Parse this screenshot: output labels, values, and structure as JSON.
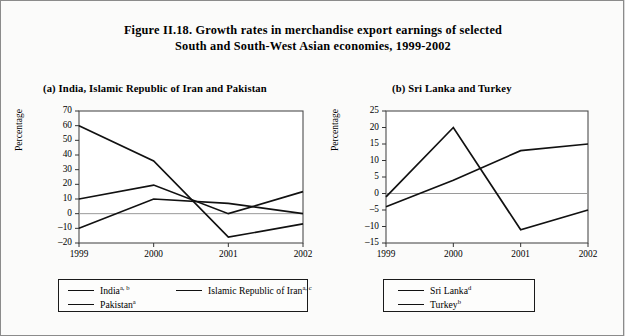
{
  "figure": {
    "title_line1": "Figure II.18.  Growth rates in merchandise export earnings of selected",
    "title_line2": "South and South-West Asian economies, 1999-2002"
  },
  "panel_a": {
    "title": "(a)  India, Islamic Republic of Iran and Pakistan",
    "ylabel": "Percentage"
  },
  "panel_b": {
    "title": "(b)  Sri Lanka and Turkey",
    "ylabel": "Percentage"
  },
  "legend_a": {
    "items": [
      {
        "label": "India",
        "sup": "a, b"
      },
      {
        "label": "Islamic Republic of Iran",
        "sup": "a, c"
      },
      {
        "label": "Pakistan",
        "sup": "a"
      }
    ]
  },
  "legend_b": {
    "items": [
      {
        "label": "Sri Lanka",
        "sup": "d"
      },
      {
        "label": "Turkey",
        "sup": "b"
      }
    ]
  },
  "chart_data": [
    {
      "type": "line",
      "panel": "(a)",
      "title": "(a)  India, Islamic Republic of Iran and Pakistan",
      "xlabel": "",
      "ylabel": "Percentage",
      "x": [
        "1999",
        "2000",
        "2001",
        "2002"
      ],
      "ylim": [
        -20,
        70
      ],
      "yticks": [
        70,
        60,
        50,
        40,
        30,
        20,
        10,
        0,
        -10,
        -20
      ],
      "grid": false,
      "zero_line": true,
      "legend_position": "below",
      "series": [
        {
          "name": "India",
          "sup": "a, b",
          "values": [
            10,
            19.5,
            0,
            15
          ]
        },
        {
          "name": "Islamic Republic of Iran",
          "sup": "a, c",
          "values": [
            60,
            36,
            -16,
            -7
          ]
        },
        {
          "name": "Pakistan",
          "sup": "a",
          "values": [
            -10,
            10,
            7,
            0
          ]
        }
      ]
    },
    {
      "type": "line",
      "panel": "(b)",
      "title": "(b)  Sri Lanka and Turkey",
      "xlabel": "",
      "ylabel": "Percentage",
      "x": [
        "1999",
        "2000",
        "2001",
        "2002"
      ],
      "ylim": [
        -15,
        25
      ],
      "yticks": [
        25,
        20,
        15,
        10,
        5,
        0,
        -5,
        -10,
        -15
      ],
      "grid": false,
      "zero_line": true,
      "legend_position": "below",
      "series": [
        {
          "name": "Sri Lanka",
          "sup": "d",
          "values": [
            -1,
            20,
            -11,
            -5
          ]
        },
        {
          "name": "Turkey",
          "sup": "b",
          "values": [
            -4,
            4,
            13,
            15
          ]
        }
      ]
    }
  ]
}
